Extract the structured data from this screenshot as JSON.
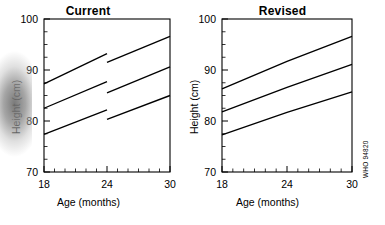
{
  "figure": {
    "watermark": "WHO 94820",
    "panel_order": [
      "current",
      "revised"
    ]
  },
  "axes": {
    "x_title": "Age (months)",
    "y_title": "Height (cm)",
    "x_ticks": [
      "18",
      "24",
      "30"
    ],
    "y_ticks": [
      "100",
      "90",
      "80",
      "70"
    ]
  },
  "chart_data": [
    {
      "type": "line",
      "title": "Current",
      "xlabel": "Age (months)",
      "ylabel": "Height (cm)",
      "xlim": [
        18,
        30
      ],
      "ylim": [
        70,
        100
      ],
      "xticks": [
        18,
        24,
        30
      ],
      "yticks": [
        70,
        80,
        90,
        100
      ],
      "x_minor_step": 1,
      "y_minor_step": 2.5,
      "grid": false,
      "legend": "none",
      "annotation": "Percentile curves are discontinuous at 24 months; each line breaks and steps upward.",
      "series": [
        {
          "name": "upper percentile (0-23 months)",
          "x": [
            18,
            24
          ],
          "values": [
            87.3,
            93.2
          ]
        },
        {
          "name": "upper percentile (24-30 months)",
          "x": [
            24,
            30
          ],
          "values": [
            91.5,
            96.6
          ]
        },
        {
          "name": "median (0-23 months)",
          "x": [
            18,
            24
          ],
          "values": [
            82.5,
            87.7
          ]
        },
        {
          "name": "median (24-30 months)",
          "x": [
            24,
            30
          ],
          "values": [
            85.5,
            90.6
          ]
        },
        {
          "name": "lower percentile (0-23 months)",
          "x": [
            18,
            24
          ],
          "values": [
            77.4,
            82.2
          ]
        },
        {
          "name": "lower percentile (24-30 months)",
          "x": [
            24,
            30
          ],
          "values": [
            80.3,
            85.0
          ]
        }
      ]
    },
    {
      "type": "line",
      "title": "Revised",
      "xlabel": "Age (months)",
      "ylabel": "Height (cm)",
      "xlim": [
        18,
        30
      ],
      "ylim": [
        70,
        100
      ],
      "xticks": [
        18,
        24,
        30
      ],
      "yticks": [
        70,
        80,
        90,
        100
      ],
      "x_minor_step": 1,
      "y_minor_step": 2.5,
      "grid": false,
      "legend": "none",
      "annotation": "Percentile curves join smoothly at 24 months with only a slight change of slope.",
      "series": [
        {
          "name": "upper percentile",
          "x": [
            18,
            24,
            30
          ],
          "values": [
            86.3,
            91.7,
            96.6
          ]
        },
        {
          "name": "median",
          "x": [
            18,
            24,
            30
          ],
          "values": [
            81.8,
            86.6,
            91.1
          ]
        },
        {
          "name": "lower percentile",
          "x": [
            18,
            24,
            30
          ],
          "values": [
            77.3,
            81.7,
            85.7
          ]
        }
      ]
    }
  ]
}
